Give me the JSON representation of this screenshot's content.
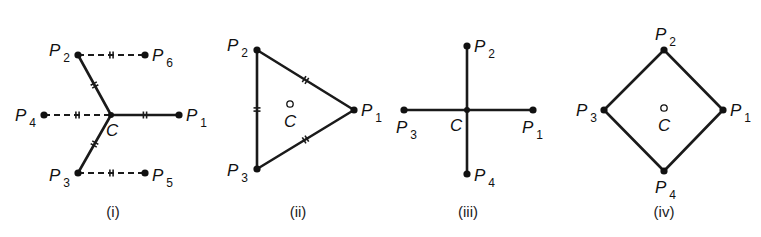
{
  "figure": {
    "panels": [
      {
        "id": "i",
        "caption": "(i)",
        "caption_pos": [
          113,
          217
        ],
        "center": {
          "label": "C",
          "x": 111,
          "y": 115,
          "style": "junction",
          "label_pos": [
            106,
            136
          ]
        },
        "points": [
          {
            "name": "P",
            "sub": "1",
            "x": 179,
            "y": 115,
            "label_pos": [
              186,
              121
            ]
          },
          {
            "name": "P",
            "sub": "2",
            "x": 78,
            "y": 55,
            "label_pos": [
              49,
              56
            ]
          },
          {
            "name": "P",
            "sub": "3",
            "x": 78,
            "y": 173,
            "label_pos": [
              49,
              181
            ]
          },
          {
            "name": "P",
            "sub": "4",
            "x": 44,
            "y": 115,
            "label_pos": [
              15,
              121
            ]
          },
          {
            "name": "P",
            "sub": "5",
            "x": 145,
            "y": 173,
            "label_pos": [
              152,
              181
            ]
          },
          {
            "name": "P",
            "sub": "6",
            "x": 145,
            "y": 55,
            "label_pos": [
              152,
              61
            ]
          }
        ],
        "edges": [
          {
            "from": [
              111,
              115
            ],
            "to": [
              179,
              115
            ],
            "style": "solid",
            "tick": 0.5
          },
          {
            "from": [
              111,
              115
            ],
            "to": [
              78,
              55
            ],
            "style": "solid",
            "tick": 0.5
          },
          {
            "from": [
              111,
              115
            ],
            "to": [
              78,
              173
            ],
            "style": "solid",
            "tick": 0.5
          },
          {
            "from": [
              44,
              115
            ],
            "to": [
              111,
              115
            ],
            "style": "dashed",
            "tick": 0.5
          },
          {
            "from": [
              78,
              55
            ],
            "to": [
              145,
              55
            ],
            "style": "dashed",
            "tick": 0.5
          },
          {
            "from": [
              78,
              173
            ],
            "to": [
              145,
              173
            ],
            "style": "dashed",
            "tick": 0.5
          }
        ]
      },
      {
        "id": "ii",
        "caption": "(ii)",
        "caption_pos": [
          298,
          217
        ],
        "center": {
          "label": "C",
          "x": 290,
          "y": 104,
          "style": "ring",
          "label_pos": [
            284,
            127
          ]
        },
        "points": [
          {
            "name": "P",
            "sub": "1",
            "x": 354,
            "y": 110,
            "label_pos": [
              361,
              116
            ]
          },
          {
            "name": "P",
            "sub": "2",
            "x": 257,
            "y": 50,
            "label_pos": [
              227,
              51
            ]
          },
          {
            "name": "P",
            "sub": "3",
            "x": 257,
            "y": 169,
            "label_pos": [
              227,
              176
            ]
          }
        ],
        "edges": [
          {
            "from": [
              257,
              50
            ],
            "to": [
              354,
              110
            ],
            "style": "solid",
            "tick": 0.5
          },
          {
            "from": [
              354,
              110
            ],
            "to": [
              257,
              169
            ],
            "style": "solid",
            "tick": 0.5
          },
          {
            "from": [
              257,
              169
            ],
            "to": [
              257,
              50
            ],
            "style": "solid",
            "tick": 0.5
          }
        ]
      },
      {
        "id": "iii",
        "caption": "(iii)",
        "caption_pos": [
          468,
          217
        ],
        "center": {
          "label": "C",
          "x": 467,
          "y": 110,
          "style": "junction",
          "label_pos": [
            450,
            131
          ]
        },
        "points": [
          {
            "name": "P",
            "sub": "1",
            "x": 533,
            "y": 110,
            "label_pos": [
              522,
              133
            ]
          },
          {
            "name": "P",
            "sub": "2",
            "x": 467,
            "y": 46,
            "label_pos": [
              474,
              52
            ]
          },
          {
            "name": "P",
            "sub": "3",
            "x": 404,
            "y": 110,
            "label_pos": [
              396,
              133
            ]
          },
          {
            "name": "P",
            "sub": "4",
            "x": 467,
            "y": 174,
            "label_pos": [
              474,
              181
            ]
          }
        ],
        "edges": [
          {
            "from": [
              404,
              110
            ],
            "to": [
              533,
              110
            ],
            "style": "solid",
            "tick": null
          },
          {
            "from": [
              467,
              46
            ],
            "to": [
              467,
              174
            ],
            "style": "solid",
            "tick": null
          }
        ]
      },
      {
        "id": "iv",
        "caption": "(iv)",
        "caption_pos": [
          664,
          217
        ],
        "center": {
          "label": "C",
          "x": 664,
          "y": 108,
          "style": "ring",
          "label_pos": [
            658,
            131
          ]
        },
        "points": [
          {
            "name": "P",
            "sub": "1",
            "x": 723,
            "y": 110,
            "label_pos": [
              730,
              116
            ]
          },
          {
            "name": "P",
            "sub": "2",
            "x": 664,
            "y": 50,
            "label_pos": [
              655,
              40
            ]
          },
          {
            "name": "P",
            "sub": "3",
            "x": 604,
            "y": 110,
            "label_pos": [
              576,
              116
            ]
          },
          {
            "name": "P",
            "sub": "4",
            "x": 664,
            "y": 171,
            "label_pos": [
              655,
              193
            ]
          }
        ],
        "edges": [
          {
            "from": [
              664,
              50
            ],
            "to": [
              723,
              110
            ],
            "style": "solid",
            "tick": null
          },
          {
            "from": [
              723,
              110
            ],
            "to": [
              664,
              171
            ],
            "style": "solid",
            "tick": null
          },
          {
            "from": [
              664,
              171
            ],
            "to": [
              604,
              110
            ],
            "style": "solid",
            "tick": null
          },
          {
            "from": [
              604,
              110
            ],
            "to": [
              664,
              50
            ],
            "style": "solid",
            "tick": null
          }
        ]
      }
    ]
  }
}
